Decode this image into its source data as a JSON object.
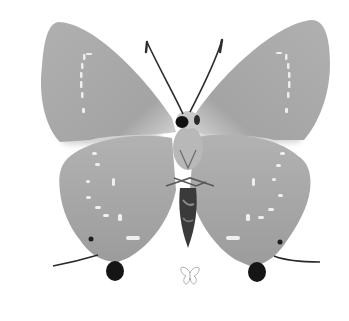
{
  "image": {
    "subject": "butterfly specimen, ventral view",
    "style": "grayscale photograph",
    "background": "#ffffff"
  },
  "colors": {
    "wing_fill": "#a9a9a9",
    "wing_light": "#d4d4d4",
    "wing_edge": "#8f8f8f",
    "body_dark": "#2e2e2e",
    "body_mid": "#7a7a7a",
    "spot_black": "#151515",
    "stripe_white": "#f0f0f0",
    "icon_stroke": "#9a9a9a"
  },
  "icon": {
    "name": "butterfly-outline-icon"
  }
}
